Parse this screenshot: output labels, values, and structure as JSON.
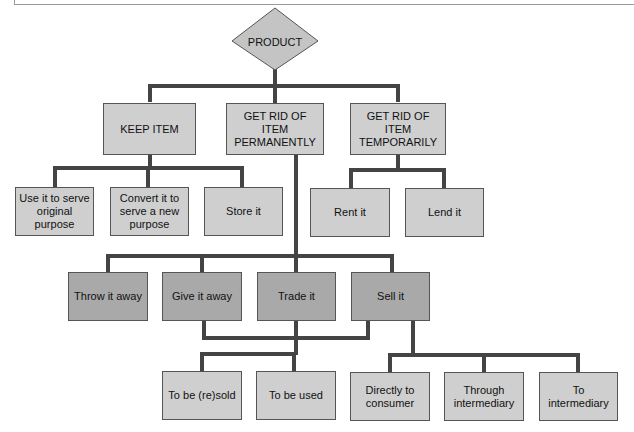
{
  "diagram": {
    "root": {
      "label": "PRODUCT",
      "shape": "diamond"
    },
    "level1": [
      {
        "id": "keep",
        "label": "KEEP ITEM"
      },
      {
        "id": "perm",
        "label": "GET RID OF ITEM PERMANENTLY"
      },
      {
        "id": "temp",
        "label": "GET RID OF ITEM TEMPORARILY"
      }
    ],
    "keep_children": [
      {
        "label": "Use it to serve original purpose"
      },
      {
        "label": "Convert it to serve a new purpose"
      },
      {
        "label": "Store it"
      }
    ],
    "temp_children": [
      {
        "label": "Rent it"
      },
      {
        "label": "Lend it"
      }
    ],
    "perm_children": [
      {
        "label": "Throw it away"
      },
      {
        "label": "Give it away"
      },
      {
        "label": "Trade it"
      },
      {
        "label": "Sell it"
      }
    ],
    "give_trade_children": [
      {
        "label": "To be (re)sold"
      },
      {
        "label": "To be used"
      }
    ],
    "sell_children": [
      {
        "label": "Directly to consumer"
      },
      {
        "label": "Through intermediary"
      },
      {
        "label": "To intermediary"
      }
    ],
    "colors": {
      "light_box": "#cfcfcf",
      "dark_box": "#a9a9a9",
      "connector": "#444444"
    }
  }
}
